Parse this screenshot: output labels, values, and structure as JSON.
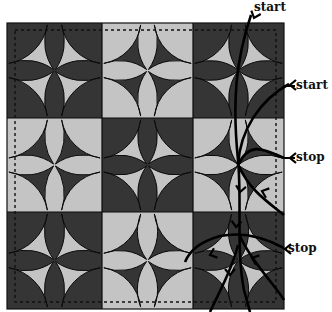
{
  "figure": {
    "grid": {
      "rows": 3,
      "cols": 3
    },
    "colors": {
      "dark": "#353535",
      "light": "#c4c4c4",
      "line": "#0a0a0a",
      "path": "#000000",
      "background": "#ffffff"
    },
    "blocks": [
      [
        "dark",
        "light",
        "dark"
      ],
      [
        "light",
        "dark",
        "light"
      ],
      [
        "dark",
        "light",
        "dark"
      ]
    ],
    "labels": [
      {
        "id": "start-top",
        "text": "start"
      },
      {
        "id": "start-right",
        "text": "start"
      },
      {
        "id": "stop-upper",
        "text": "stop"
      },
      {
        "id": "stop-lower",
        "text": "stop"
      }
    ]
  }
}
